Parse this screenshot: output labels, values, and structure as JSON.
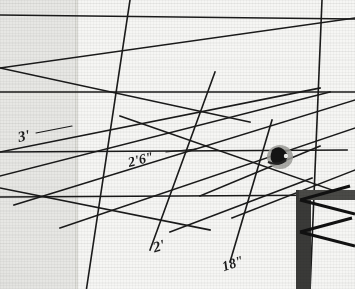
{
  "scene": {
    "title": "Scanned surveying layout photograph with handwritten dimensions",
    "media": "grainy black-and-white scan of gridded paper with ruled straight lines",
    "ink_color": "#1a1a1a",
    "paper_left_color": "#e7e7e4",
    "paper_right_color": "#f6f6f4",
    "fold_color": "#cfcfca"
  },
  "annotations": [
    {
      "id": "dim-3ft",
      "text": "3'",
      "x": 18,
      "y": 128,
      "rotation": -12,
      "size": 15
    },
    {
      "id": "dim-2ft6",
      "text": "2'6\"",
      "x": 128,
      "y": 152,
      "rotation": -14,
      "size": 14
    },
    {
      "id": "dim-2ft",
      "text": "2'",
      "x": 153,
      "y": 238,
      "rotation": -16,
      "size": 15
    },
    {
      "id": "dim-18in",
      "text": "18\"",
      "x": 222,
      "y": 256,
      "rotation": -18,
      "size": 14
    }
  ],
  "leaders": [
    {
      "id": "leader-3ft",
      "x1": 36,
      "y1": 133,
      "x2": 72,
      "y2": 126
    },
    {
      "id": "leader-2ft6",
      "x1": 166,
      "y1": 152,
      "x2": 196,
      "y2": 149
    }
  ],
  "lines": {
    "horizontals": [
      {
        "id": "h-top",
        "x1": 0,
        "y1": 15,
        "x2": 355,
        "y2": 19
      },
      {
        "id": "h-mid",
        "x1": 0,
        "y1": 92,
        "x2": 355,
        "y2": 92
      },
      {
        "id": "h-low",
        "x1": 0,
        "y1": 152,
        "x2": 347,
        "y2": 150
      },
      {
        "id": "h-bottom",
        "x1": 0,
        "y1": 197,
        "x2": 355,
        "y2": 195
      }
    ],
    "diagonals": [
      {
        "id": "d-1",
        "x1": 0,
        "y1": 68,
        "x2": 355,
        "y2": 18
      },
      {
        "id": "d-2",
        "x1": 0,
        "y1": 68,
        "x2": 250,
        "y2": 122
      },
      {
        "id": "d-3",
        "x1": 0,
        "y1": 152,
        "x2": 320,
        "y2": 88
      },
      {
        "id": "d-4",
        "x1": 0,
        "y1": 176,
        "x2": 330,
        "y2": 92
      },
      {
        "id": "d-5",
        "x1": 0,
        "y1": 188,
        "x2": 210,
        "y2": 230
      },
      {
        "id": "d-6",
        "x1": 14,
        "y1": 205,
        "x2": 355,
        "y2": 100
      },
      {
        "id": "d-7",
        "x1": 60,
        "y1": 228,
        "x2": 355,
        "y2": 128
      },
      {
        "id": "d-8",
        "x1": 86,
        "y1": 292,
        "x2": 130,
        "y2": 0
      },
      {
        "id": "d-9",
        "x1": 150,
        "y1": 250,
        "x2": 215,
        "y2": 72
      },
      {
        "id": "d-10",
        "x1": 230,
        "y1": 262,
        "x2": 272,
        "y2": 120
      },
      {
        "id": "d-11",
        "x1": 310,
        "y1": 292,
        "x2": 322,
        "y2": 0
      },
      {
        "id": "d-12",
        "x1": 120,
        "y1": 116,
        "x2": 355,
        "y2": 198
      },
      {
        "id": "d-13",
        "x1": 200,
        "y1": 196,
        "x2": 320,
        "y2": 146
      },
      {
        "id": "d-14",
        "x1": 232,
        "y1": 218,
        "x2": 355,
        "y2": 170
      },
      {
        "id": "d-15",
        "x1": 170,
        "y1": 232,
        "x2": 312,
        "y2": 178
      }
    ]
  },
  "vanishing_points": [
    {
      "id": "vp-upper-right",
      "x": 322,
      "y": 18
    },
    {
      "id": "vp-mid-right",
      "x": 318,
      "y": 89
    },
    {
      "id": "vp-lower-right",
      "x": 311,
      "y": 196
    }
  ],
  "objects": [
    {
      "id": "ink-smudge",
      "label": "dark smudge",
      "x": 268,
      "y": 145,
      "w": 26,
      "h": 26
    },
    {
      "id": "corner-post",
      "label": "dark corner post structure",
      "x": 296,
      "y": 190,
      "w": 16,
      "h": 100
    },
    {
      "id": "post-cap",
      "label": "dark horizontal cap beam",
      "x": 300,
      "y": 190,
      "w": 55,
      "h": 11
    }
  ]
}
